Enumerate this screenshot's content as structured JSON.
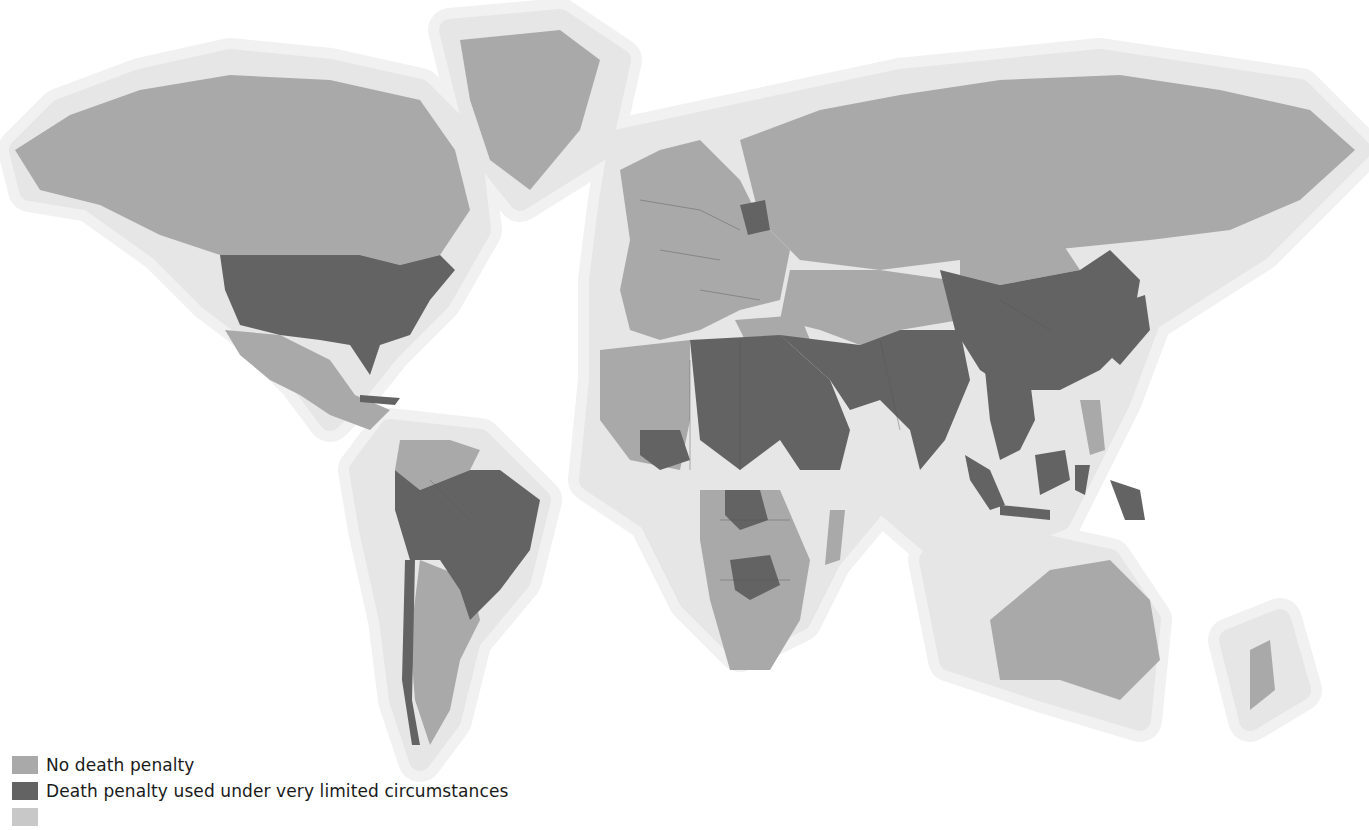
{
  "map": {
    "colors": {
      "no_death_penalty": "#a9a9a9",
      "limited_circumstances": "#636363",
      "halo_inner": "#e6e6e6",
      "halo_outer": "#f1f1f1",
      "background": "#ffffff"
    }
  },
  "legend": {
    "items": [
      {
        "label": "No death penalty",
        "color": "#a9a9a9"
      },
      {
        "label": "Death penalty used under very limited circumstances",
        "color": "#636363"
      },
      {
        "label": "",
        "color": "#c8c8c8"
      }
    ]
  },
  "regions": {
    "no_death_penalty": [
      "Canada",
      "Greenland",
      "Mexico",
      "Colombia",
      "Venezuela",
      "Argentina",
      "Chile",
      "Uruguay",
      "Europe",
      "Russia",
      "Kazakhstan",
      "Central Asia",
      "Turkey",
      "Western Africa",
      "Central Africa",
      "Angola",
      "Namibia",
      "South Africa",
      "Mozambique",
      "Madagascar",
      "Australia",
      "New Zealand",
      "Philippines",
      "Cambodia",
      "Mongolia",
      "South Korea",
      "Nepal",
      "Sri Lanka"
    ],
    "limited_circumstances": [
      "United States",
      "Brazil",
      "Peru",
      "Bolivia",
      "Paraguay",
      "Guyana",
      "Cuba",
      "Guatemala",
      "Belarus",
      "Libya",
      "Egypt",
      "Sudan",
      "Chad",
      "Ethiopia",
      "Somalia",
      "Nigeria",
      "DR Congo",
      "Zimbabwe",
      "Botswana",
      "Saudi Arabia",
      "Iran",
      "Iraq",
      "Afghanistan",
      "Pakistan",
      "India",
      "China",
      "North Korea",
      "Japan",
      "Myanmar",
      "Thailand",
      "Vietnam",
      "Malaysia",
      "Indonesia",
      "Papua"
    ]
  }
}
